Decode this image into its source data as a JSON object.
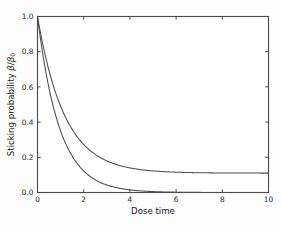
{
  "chart_data": {
    "type": "line",
    "title": "",
    "xlabel": "Dose time",
    "ylabel": "Sticking probability β/β₀",
    "ylabel_parts": {
      "text": "Sticking probability ",
      "symbol": "β",
      "slash": "/",
      "symbol2": "β",
      "subscript": "0"
    },
    "xlim": [
      0,
      10
    ],
    "ylim": [
      0.0,
      1.0
    ],
    "xticks": [
      0,
      2,
      4,
      6,
      8,
      10
    ],
    "xticklabels": [
      "0",
      "2",
      "4",
      "6",
      "8",
      "10"
    ],
    "yticks": [
      0.0,
      0.2,
      0.4,
      0.6,
      0.8,
      1.0
    ],
    "yticklabels": [
      "0.0",
      "0.2",
      "0.4",
      "0.6",
      "0.8",
      "1.0"
    ],
    "grid": false,
    "legend": null,
    "legend_position": "none",
    "line_color": "#4d4d4d",
    "series": [
      {
        "name": "curve-lower",
        "description": "exponential decay to zero baseline",
        "model": "exp(-k*t)",
        "k": 1.05,
        "baseline": 0.0,
        "x": [
          0.0,
          0.2,
          0.4,
          0.6,
          0.8,
          1.0,
          1.2,
          1.4,
          1.6,
          1.8,
          2.0,
          2.2,
          2.4,
          2.6,
          2.8,
          3.0,
          3.2,
          3.4,
          3.6,
          3.8,
          4.0,
          4.4,
          4.8,
          5.2,
          5.6,
          6.0,
          6.5,
          7.0,
          7.5,
          8.0,
          8.5,
          9.0,
          9.5,
          10.0
        ],
        "values": [
          1.0,
          0.811,
          0.657,
          0.533,
          0.432,
          0.35,
          0.284,
          0.23,
          0.186,
          0.151,
          0.122,
          0.099,
          0.08,
          0.065,
          0.053,
          0.043,
          0.035,
          0.028,
          0.023,
          0.018,
          0.015,
          0.01,
          0.006,
          0.004,
          0.003,
          0.002,
          0.001,
          0.001,
          0.0,
          0.0,
          0.0,
          0.0,
          0.0,
          0.0
        ]
      },
      {
        "name": "curve-upper",
        "description": "exponential decay to nonzero plateau",
        "model": "c + (1-c)*exp(-k*t)",
        "k": 0.85,
        "baseline": 0.11,
        "x": [
          0.0,
          0.2,
          0.4,
          0.6,
          0.8,
          1.0,
          1.2,
          1.4,
          1.6,
          1.8,
          2.0,
          2.2,
          2.4,
          2.6,
          2.8,
          3.0,
          3.2,
          3.4,
          3.6,
          3.8,
          4.0,
          4.4,
          4.8,
          5.2,
          5.6,
          6.0,
          6.5,
          7.0,
          7.5,
          8.0,
          8.5,
          9.0,
          9.5,
          10.0
        ],
        "values": [
          1.0,
          0.861,
          0.744,
          0.645,
          0.562,
          0.49,
          0.43,
          0.379,
          0.336,
          0.299,
          0.268,
          0.241,
          0.219,
          0.199,
          0.183,
          0.169,
          0.157,
          0.147,
          0.138,
          0.131,
          0.125,
          0.115,
          0.11,
          0.11,
          0.11,
          0.11,
          0.11,
          0.11,
          0.11,
          0.11,
          0.11,
          0.11,
          0.11,
          0.11
        ]
      }
    ]
  }
}
